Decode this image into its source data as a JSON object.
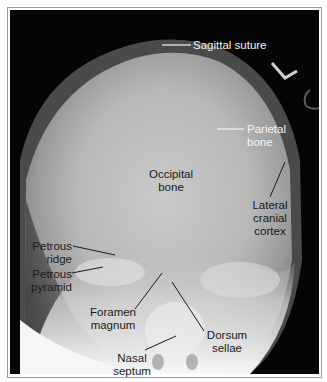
{
  "figure": {
    "type": "radiograph",
    "view": "axial skull X-ray",
    "labels": {
      "sagittal_suture": "Sagittal suture",
      "parietal_bone_1": "Parietal",
      "parietal_bone_2": "bone",
      "occipital_bone_1": "Occipital",
      "occipital_bone_2": "bone",
      "lateral_cranial_cortex_1": "Lateral",
      "lateral_cranial_cortex_2": "cranial",
      "lateral_cranial_cortex_3": "cortex",
      "petrous_ridge_1": "Petrous",
      "petrous_ridge_2": "ridge",
      "petrous_pyramid_1": "Petrous",
      "petrous_pyramid_2": "pyramid",
      "foramen_magnum_1": "Foramen",
      "foramen_magnum_2": "magnum",
      "dorsum_sellae_1": "Dorsum",
      "dorsum_sellae_2": "sellae",
      "nasal_septum_1": "Nasal",
      "nasal_septum_2": "septum"
    },
    "colors": {
      "background": "#050505",
      "light_label": "#f4f4f4",
      "dark_label": "#1a1a1a",
      "frame": "#9a9a9a"
    }
  }
}
